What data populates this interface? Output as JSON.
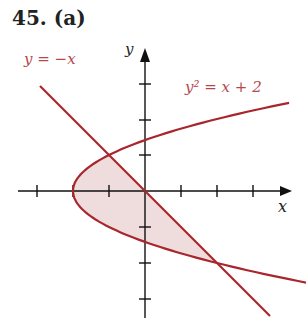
{
  "problem": {
    "number": "45.",
    "part": "(a)",
    "title": "45.  (a)"
  },
  "equations": {
    "line": "y = −x",
    "parabola": "y² = x + 2"
  },
  "axes": {
    "x_label": "x",
    "y_label": "y"
  },
  "colors": {
    "curve": "#a8262c",
    "fill": "#efdcdc",
    "axis": "#111111",
    "label": "#b5474b"
  },
  "chart_data": {
    "type": "line",
    "title": "45. (a)",
    "xlabel": "x",
    "ylabel": "y",
    "xlim": [
      -3.1,
      4.1
    ],
    "ylim": [
      -3.5,
      3.9
    ],
    "ticks": {
      "x": [
        -3,
        -2,
        -1,
        1,
        2,
        3
      ],
      "y": [
        -3,
        -2,
        -1,
        1,
        2,
        3
      ]
    },
    "series": [
      {
        "name": "y = −x",
        "kind": "line",
        "points": [
          [
            -2.9,
            2.9
          ],
          [
            3.5,
            -3.5
          ]
        ]
      },
      {
        "name": "y² = x + 2",
        "kind": "parabola",
        "x_range": [
          -2,
          4
        ]
      }
    ],
    "intersections": [
      [
        -1,
        1
      ],
      [
        2,
        -2
      ]
    ],
    "shaded_region": "between y = −x and y² = x + 2 from y = −2 to y = 1",
    "grid": false
  }
}
